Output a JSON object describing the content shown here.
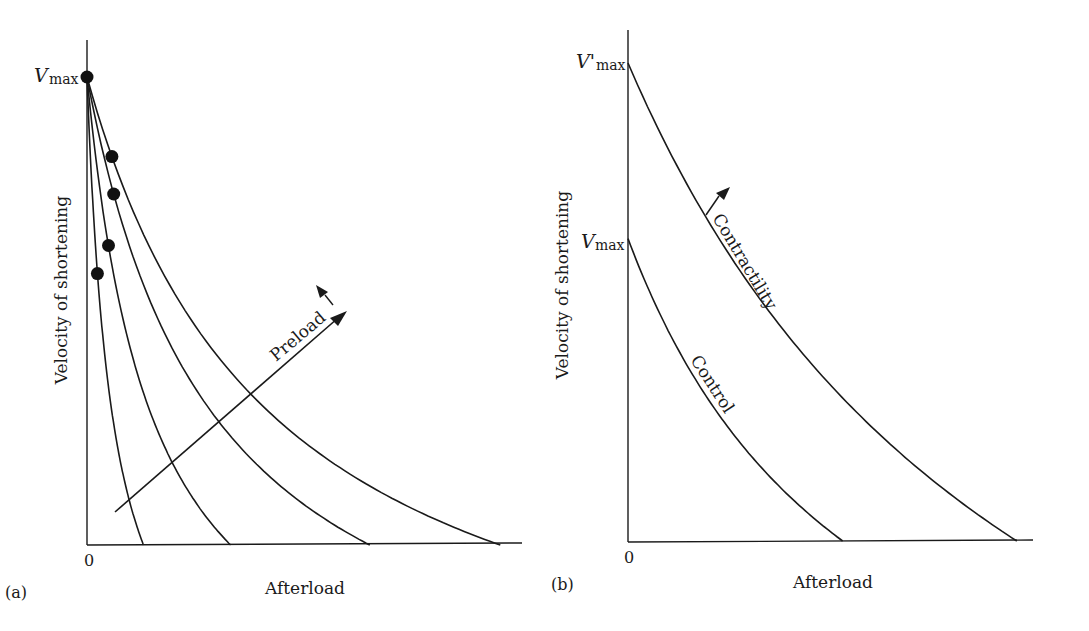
{
  "chart_data": [
    {
      "panel": "a",
      "type": "line",
      "panel_label": "(a)",
      "title": "",
      "xlabel": "Afterload",
      "ylabel": "Velocity of shortening",
      "x_tick_labels": [
        "0"
      ],
      "y_tick_labels": [
        "Vmax"
      ],
      "y_tick_label_main": "V",
      "y_tick_label_sub": "max",
      "grid": false,
      "xlim": [
        0,
        1
      ],
      "ylim": [
        0,
        1
      ],
      "series": [
        {
          "name": "preload-1",
          "vmax": 1.0,
          "x_intercept": 0.13,
          "marker_y": 0.58
        },
        {
          "name": "preload-2",
          "vmax": 1.0,
          "x_intercept": 0.33,
          "marker_y": 0.64
        },
        {
          "name": "preload-3",
          "vmax": 1.0,
          "x_intercept": 0.65,
          "marker_y": 0.75
        },
        {
          "name": "preload-4",
          "vmax": 1.0,
          "x_intercept": 0.95,
          "marker_y": 0.83
        }
      ],
      "markers": [
        {
          "x": 0.0,
          "y": 1.0
        }
      ],
      "annotations": [
        {
          "text": "Preload",
          "type": "arrow",
          "direction": "increasing"
        }
      ]
    },
    {
      "panel": "b",
      "type": "line",
      "panel_label": "(b)",
      "title": "",
      "xlabel": "Afterload",
      "ylabel": "Velocity of shortening",
      "x_tick_labels": [
        "0"
      ],
      "y_tick_labels": [
        "V'max",
        "Vmax"
      ],
      "y_ticks": [
        {
          "main": "V'",
          "sub": "max",
          "value": 0.98
        },
        {
          "main": "V",
          "sub": "max",
          "value": 0.62
        }
      ],
      "grid": false,
      "xlim": [
        0,
        1
      ],
      "ylim": [
        0,
        1
      ],
      "series": [
        {
          "name": "Control",
          "vmax": 0.62,
          "x_intercept": 0.53
        },
        {
          "name": "Contractility",
          "vmax": 0.98,
          "x_intercept": 0.96
        }
      ],
      "annotations": [
        {
          "text": "Control",
          "type": "curve-label"
        },
        {
          "text": "Contractility",
          "type": "arrow",
          "direction": "increasing"
        }
      ]
    }
  ]
}
